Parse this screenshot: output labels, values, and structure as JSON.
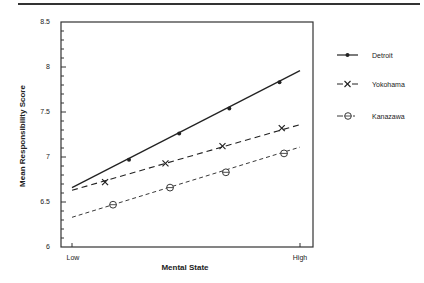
{
  "chart_data": {
    "type": "line",
    "title": "",
    "xlabel": "Mental State",
    "ylabel": "Mean Responsibility Score",
    "ylim": [
      6,
      8.5
    ],
    "yticks": [
      "6",
      "6.5",
      "7",
      "7.5",
      "8",
      "8.5"
    ],
    "xticks": [
      "Low",
      "High"
    ],
    "grid": false,
    "legend_position": "right",
    "series": [
      {
        "name": "Detroit",
        "style": "solid",
        "marker": "filled-circle",
        "line_start": 6.66,
        "line_end": 7.96,
        "points": [
          {
            "x": 0.25,
            "y": 6.97
          },
          {
            "x": 0.47,
            "y": 7.26
          },
          {
            "x": 0.69,
            "y": 7.54
          },
          {
            "x": 0.91,
            "y": 7.83
          }
        ]
      },
      {
        "name": "Yokohama",
        "style": "long-dash",
        "marker": "x",
        "line_start": 6.63,
        "line_end": 7.36,
        "points": [
          {
            "x": 0.145,
            "y": 6.72
          },
          {
            "x": 0.41,
            "y": 6.93
          },
          {
            "x": 0.66,
            "y": 7.12
          },
          {
            "x": 0.92,
            "y": 7.32
          }
        ]
      },
      {
        "name": "Kanazawa",
        "style": "short-dash",
        "marker": "open-circle",
        "line_start": 6.33,
        "line_end": 7.11,
        "points": [
          {
            "x": 0.18,
            "y": 6.47
          },
          {
            "x": 0.43,
            "y": 6.66
          },
          {
            "x": 0.675,
            "y": 6.83
          },
          {
            "x": 0.93,
            "y": 7.04
          }
        ]
      }
    ]
  },
  "axes": {
    "y_title": "Mean Responsibility Score",
    "x_title": "Mental State",
    "y_ticks": [
      "6",
      "6.5",
      "7",
      "7.5",
      "8",
      "8.5"
    ],
    "x_low": "Low",
    "x_high": "High"
  },
  "legend": {
    "items": [
      {
        "label": "Detroit"
      },
      {
        "label": "Yokohama"
      },
      {
        "label": "Kanazawa"
      }
    ]
  }
}
